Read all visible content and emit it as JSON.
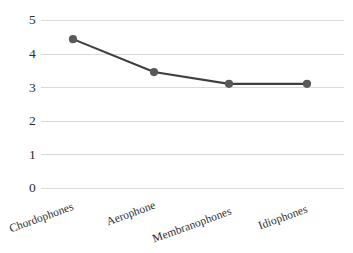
{
  "chart_data": {
    "type": "line",
    "title": "",
    "subtitle": "",
    "xlabel": "",
    "ylabel": "",
    "categories": [
      "Chordophones",
      "Aerophone",
      "Membranophones",
      "Idiophones"
    ],
    "values": [
      4.43,
      3.45,
      3.1,
      3.1
    ],
    "series": [
      {
        "name": "",
        "values": [
          4.43,
          3.45,
          3.1,
          3.1
        ]
      }
    ],
    "ylim": [
      0,
      5
    ],
    "yticks": [
      "0",
      "1",
      "2",
      "3",
      "4",
      "5"
    ],
    "ytick_values": [
      0,
      1,
      2,
      3,
      4,
      5
    ],
    "grid": true,
    "grid_axis": "y",
    "legend": false,
    "legend_position": "none",
    "annotations": [],
    "marker": "circle",
    "colors": {
      "line": "#3f3f3f",
      "marker": "#595959",
      "gridline": "#d9d9d9",
      "text": "#2b2b2b",
      "background": "#ffffff"
    }
  }
}
